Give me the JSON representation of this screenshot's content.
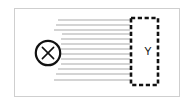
{
  "diagram": {
    "frame": {
      "name": "outer-frame",
      "x": 14,
      "y": 8,
      "width": 166,
      "height": 89,
      "stroke": "#cfcfcf",
      "fill": "#ffffff"
    },
    "source": {
      "name": "source-node",
      "label": "X",
      "shape": "circle",
      "cx": 48,
      "cy": 53,
      "r": 12.2,
      "stroke": "#111111",
      "fill": "#ffffff",
      "glyph": "x-mark"
    },
    "target": {
      "name": "target-region",
      "label": "Y",
      "shape": "dashed-rectangle",
      "x": 131,
      "y": 18,
      "width": 27,
      "height": 67,
      "stroke": "#111111",
      "dash": "4.2 2.6",
      "label_x": 148,
      "label_y": 52
    },
    "beam": {
      "name": "ray-beam",
      "stroke": "#9a9a9a",
      "stroke_width": 0.85,
      "end_x": 130,
      "rays": [
        {
          "x1": 58,
          "y1": 20,
          "x2": 130,
          "y2": 20
        },
        {
          "x1": 56,
          "y1": 25,
          "x2": 130,
          "y2": 25
        },
        {
          "x1": 54,
          "y1": 30,
          "x2": 130,
          "y2": 30
        },
        {
          "x1": 62,
          "y1": 34,
          "x2": 130,
          "y2": 34
        },
        {
          "x1": 61,
          "y1": 39,
          "x2": 130,
          "y2": 39
        },
        {
          "x1": 61,
          "y1": 44,
          "x2": 130,
          "y2": 44
        },
        {
          "x1": 61,
          "y1": 49,
          "x2": 130,
          "y2": 49
        },
        {
          "x1": 61,
          "y1": 54,
          "x2": 130,
          "y2": 54
        },
        {
          "x1": 61,
          "y1": 59,
          "x2": 130,
          "y2": 59
        },
        {
          "x1": 61,
          "y1": 64,
          "x2": 130,
          "y2": 64
        },
        {
          "x1": 58,
          "y1": 69,
          "x2": 130,
          "y2": 69
        },
        {
          "x1": 56,
          "y1": 74,
          "x2": 130,
          "y2": 74
        },
        {
          "x1": 54,
          "y1": 80,
          "x2": 130,
          "y2": 80
        }
      ]
    },
    "colors": {
      "frame_border": "#cfcfcf",
      "ink": "#111111",
      "ray": "#9a9a9a",
      "background": "#ffffff"
    }
  }
}
